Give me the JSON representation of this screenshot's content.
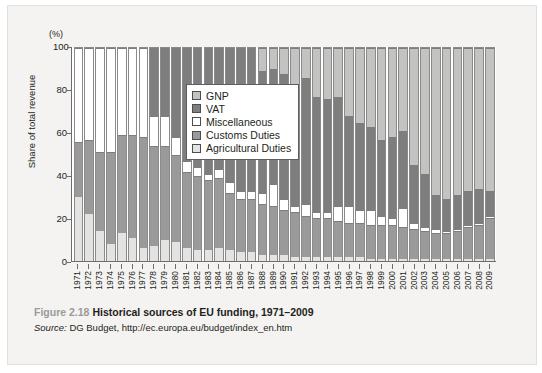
{
  "figure": {
    "number": "Figure 2.18",
    "title": "Historical sources of EU funding, 1971–2009",
    "source_label": "Source:",
    "source_text": " DG Budget, http://ec.europa.eu/budget/index_en.htm"
  },
  "chart_data": {
    "type": "bar",
    "stacked": true,
    "title": "Historical sources of EU funding, 1971–2009",
    "xlabel": "",
    "ylabel": "Share of total revenue",
    "unit_label": "(%)",
    "ylim": [
      0,
      100
    ],
    "yticks": [
      0,
      20,
      40,
      60,
      80,
      100
    ],
    "grid": false,
    "legend_position": "top-center-inside",
    "categories": [
      "1971",
      "1972",
      "1973",
      "1974",
      "1975",
      "1976",
      "1977",
      "1978",
      "1979",
      "1980",
      "1981",
      "1982",
      "1983",
      "1984",
      "1985",
      "1986",
      "1987",
      "1988",
      "1989",
      "1990",
      "1991",
      "1992",
      "1993",
      "1994",
      "1995",
      "1996",
      "1997",
      "1998",
      "1999",
      "2000",
      "2001",
      "2002",
      "2003",
      "2004",
      "2005",
      "2006",
      "2007",
      "2008",
      "2009"
    ],
    "series": [
      {
        "name": "Agricultural Duties",
        "color": "#e3e3e1",
        "values": [
          30,
          22,
          14,
          8,
          13,
          11,
          6,
          7,
          10,
          9,
          6,
          5,
          5,
          6,
          5,
          4,
          4,
          3,
          3,
          3,
          2,
          2,
          2,
          2,
          2,
          2,
          2,
          1,
          1,
          1,
          1,
          1,
          1,
          1,
          1,
          1,
          1,
          1,
          1
        ]
      },
      {
        "name": "Customs Duties",
        "color": "#9a9a9a",
        "values": [
          26,
          35,
          37,
          43,
          46,
          48,
          52,
          47,
          44,
          41,
          36,
          35,
          33,
          33,
          27,
          25,
          25,
          24,
          23,
          21,
          21,
          19,
          18,
          18,
          17,
          16,
          16,
          16,
          16,
          16,
          15,
          14,
          13,
          12,
          12,
          13,
          15,
          16,
          19
        ]
      },
      {
        "name": "Miscellaneous",
        "color": "#ffffff",
        "values": [
          44,
          43,
          49,
          49,
          41,
          41,
          42,
          14,
          14,
          8,
          5,
          4,
          3,
          4,
          5,
          4,
          4,
          5,
          10,
          5,
          3,
          6,
          3,
          3,
          7,
          8,
          6,
          7,
          4,
          3,
          9,
          3,
          2,
          2,
          1,
          1,
          1,
          1,
          1
        ]
      },
      {
        "name": "VAT",
        "color": "#7e7e7e",
        "values": [
          0,
          0,
          0,
          0,
          0,
          0,
          0,
          32,
          32,
          42,
          53,
          56,
          59,
          57,
          63,
          67,
          67,
          57,
          54,
          59,
          56,
          59,
          54,
          53,
          51,
          42,
          41,
          39,
          36,
          38,
          36,
          27,
          25,
          16,
          15,
          16,
          16,
          16,
          12
        ]
      },
      {
        "name": "GNP",
        "color": "#c3c3c1",
        "values": [
          0,
          0,
          0,
          0,
          0,
          0,
          0,
          0,
          0,
          0,
          0,
          0,
          0,
          0,
          0,
          0,
          0,
          11,
          10,
          12,
          18,
          14,
          23,
          24,
          23,
          32,
          35,
          37,
          43,
          42,
          39,
          55,
          59,
          69,
          71,
          69,
          67,
          66,
          67
        ]
      }
    ],
    "series_order_bottom_to_top": [
      "Agricultural Duties",
      "Customs Duties",
      "Miscellaneous",
      "VAT",
      "GNP"
    ],
    "legend": [
      {
        "label": "GNP",
        "color": "#c3c3c1"
      },
      {
        "label": "VAT",
        "color": "#7e7e7e"
      },
      {
        "label": "Miscellaneous",
        "color": "#ffffff"
      },
      {
        "label": "Customs Duties",
        "color": "#9a9a9a"
      },
      {
        "label": "Agricultural Duties",
        "color": "#e3e3e1"
      }
    ]
  }
}
